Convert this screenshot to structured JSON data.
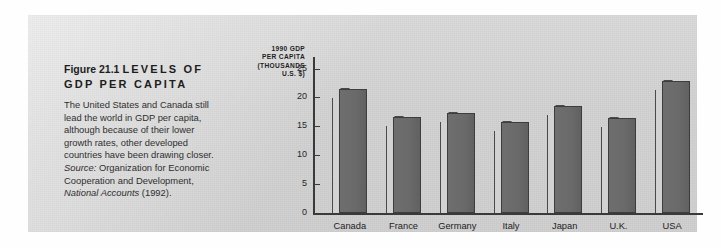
{
  "figure": {
    "number": "Figure 21.1",
    "title": "LEVELS OF GDP PER CAPITA",
    "body": "The United States and Canada still lead the world in GDP per capita, although because of their lower growth rates, other developed countries have been drawing closer. ",
    "source_label": "Source:",
    "source_text": " Organization for Economic Cooperation and Development, ",
    "source_italic": "National Accounts",
    "source_year": " (1992)."
  },
  "colors": {
    "panel_background": "#d4d4d4",
    "bar_fill": "#6a6a6a",
    "bar_side": "#d2d2d2",
    "axis": "#3a3a3a",
    "text": "#2c2c2c"
  },
  "chart_data": {
    "type": "bar",
    "title": "",
    "axis_title_lines": [
      "1990 GDP",
      "PER CAPITA",
      "(THOUSANDS",
      "U.S. $)"
    ],
    "ylabel": "1990 GDP PER CAPITA (THOUSANDS U.S. $)",
    "xlabel": "",
    "categories": [
      "Canada",
      "France",
      "Germany",
      "Italy",
      "Japan",
      "U.K.",
      "USA"
    ],
    "values": [
      19.9,
      15.0,
      15.8,
      14.2,
      16.9,
      14.9,
      21.3
    ],
    "ylim": [
      0,
      27
    ],
    "yticks": [
      0,
      5,
      10,
      15,
      20,
      25
    ],
    "ytick_labels": [
      "0",
      "5",
      "10",
      "15",
      "20",
      "25"
    ],
    "grid": false,
    "legend": false
  }
}
